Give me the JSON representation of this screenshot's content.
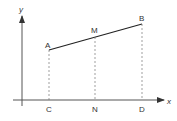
{
  "diagram": {
    "axes": {
      "x_label": "x",
      "y_label": "y"
    },
    "points": {
      "A": "A",
      "M": "M",
      "B": "B",
      "C": "C",
      "N": "N",
      "D": "D"
    },
    "colors": {
      "line": "#222222",
      "axis": "#444444",
      "dashed": "#777777"
    }
  }
}
